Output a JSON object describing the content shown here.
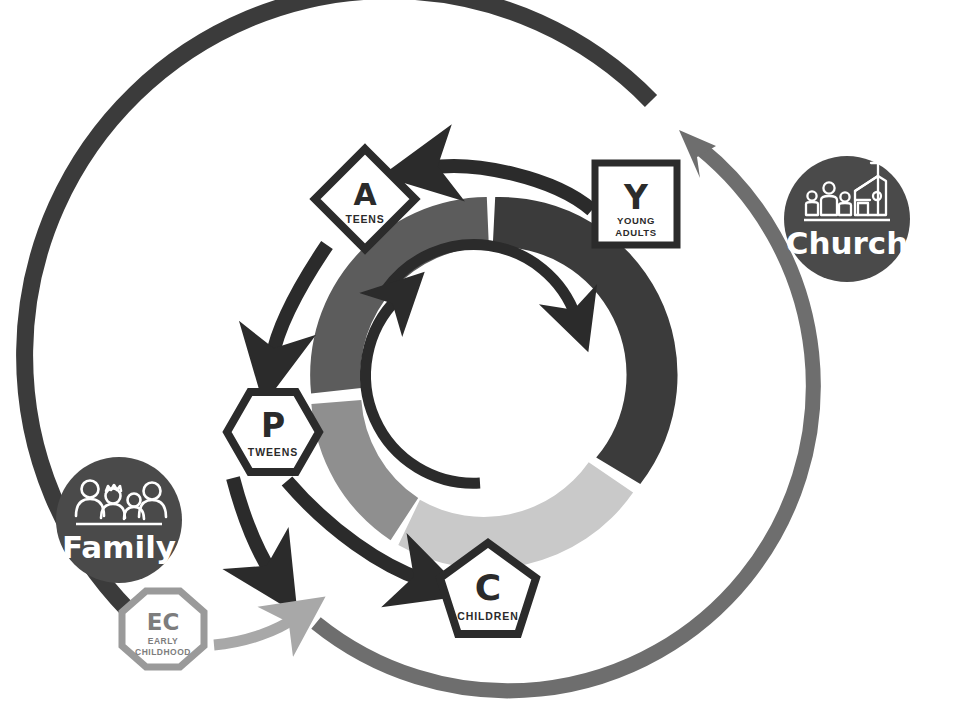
{
  "diagram": {
    "background_color": "#ffffff"
  },
  "palette": {
    "ink": "#3a3a3a",
    "black": "#2b2b2b",
    "dark_gray": "#4f4f4f",
    "mid_gray": "#6e6e6e",
    "light_gray": "#a8a8a8",
    "pale_gray": "#c9c9c9",
    "hub_fill": "#4a4a4a",
    "white": "#ffffff"
  },
  "hubs": [
    {
      "id": "family",
      "label": "Family",
      "icon": "family-group-icon",
      "fill": "#4a4a4a",
      "text_color": "#ffffff",
      "cx": 119,
      "cy": 520,
      "r": 63
    },
    {
      "id": "church",
      "label": "Church",
      "icon": "church-building-icon",
      "fill": "#4a4a4a",
      "text_color": "#ffffff",
      "cx": 847,
      "cy": 219,
      "r": 63
    }
  ],
  "stages": [
    {
      "id": "teens",
      "letter": "A",
      "caption": "TEENS",
      "shape": "diamond",
      "shape_sides": 4,
      "cx": 365,
      "cy": 199,
      "r": 48,
      "stroke": "#2b2b2b",
      "fill": "#ffffff"
    },
    {
      "id": "young-adults",
      "letter": "Y",
      "caption": "YOUNG ADULTS",
      "caption_lines": [
        "YOUNG",
        "ADULTS"
      ],
      "shape": "square",
      "shape_sides": 4,
      "cx": 636,
      "cy": 204,
      "r": 44,
      "stroke": "#2b2b2b",
      "fill": "#ffffff"
    },
    {
      "id": "tweens",
      "letter": "P",
      "caption": "TWEENS",
      "shape": "hexagon",
      "shape_sides": 6,
      "cx": 273,
      "cy": 432,
      "r": 46,
      "stroke": "#2b2b2b",
      "fill": "#ffffff"
    },
    {
      "id": "children",
      "letter": "C",
      "caption": "CHILDREN",
      "shape": "pentagon",
      "shape_sides": 5,
      "cx": 488,
      "cy": 593,
      "r": 50,
      "stroke": "#2b2b2b",
      "fill": "#ffffff"
    },
    {
      "id": "early-childhood",
      "letter": "EC",
      "caption": "EARLY CHILDHOOD",
      "caption_lines": [
        "EARLY",
        "CHILDHOOD"
      ],
      "shape": "octagon",
      "shape_sides": 8,
      "cx": 163,
      "cy": 629,
      "r": 41,
      "stroke": "#9a9a9a",
      "fill": "#ffffff"
    }
  ],
  "ring": {
    "cx": 489,
    "cy": 375,
    "outer_r": 178,
    "inner_r": 128,
    "gap_degrees": 4,
    "segments": [
      {
        "id": "segment-young-adults",
        "color": "#3b3b3b",
        "start_deg": -88,
        "end_deg": 32,
        "maps_to": "young-adults"
      },
      {
        "id": "segment-children",
        "color": "#c9c9c9",
        "start_deg": 36,
        "end_deg": 108,
        "maps_to": "children"
      },
      {
        "id": "segment-tweens",
        "color": "#8f8f8f",
        "start_deg": 112,
        "end_deg": 176,
        "maps_to": "tweens"
      },
      {
        "id": "segment-teens",
        "color": "#5c5c5c",
        "start_deg": 180,
        "end_deg": 268,
        "maps_to": "teens"
      }
    ]
  },
  "inner_arrows": [
    {
      "id": "inner-arc-top",
      "color": "#2b2b2b",
      "start_deg": 200,
      "end_deg": 292,
      "direction": "clockwise"
    },
    {
      "id": "inner-arc-bottom",
      "color": "#2b2b2b",
      "start_deg": 80,
      "end_deg": 178,
      "direction": "counter-clockwise"
    }
  ],
  "flow_arrows": [
    {
      "id": "arrow-young-adults-to-teens",
      "from": "young-adults",
      "to": "teens",
      "color": "#2b2b2b",
      "style": "curved"
    },
    {
      "id": "arrow-teens-to-tweens",
      "from": "teens",
      "to": "tweens",
      "color": "#2b2b2b",
      "style": "curved"
    },
    {
      "id": "arrow-tweens-to-children",
      "from": "tweens",
      "to": "children",
      "color": "#2b2b2b",
      "style": "curved"
    },
    {
      "id": "arrow-tweens-to-early-childhood",
      "from": "tweens",
      "to": "early-childhood",
      "color": "#2b2b2b",
      "style": "curved"
    },
    {
      "id": "arrow-early-childhood-to-children",
      "from": "early-childhood",
      "to": "children",
      "color": "#a8a8a8",
      "style": "curved"
    }
  ],
  "outer_arcs": [
    {
      "id": "outer-arc-family-to-young-adults",
      "color": "#3b3b3b",
      "from": "family",
      "to": "young-adults",
      "arrow_head": false
    },
    {
      "id": "outer-arc-children-to-church",
      "color": "#6e6e6e",
      "from": "children",
      "to": "church",
      "arrow_head": true
    }
  ]
}
